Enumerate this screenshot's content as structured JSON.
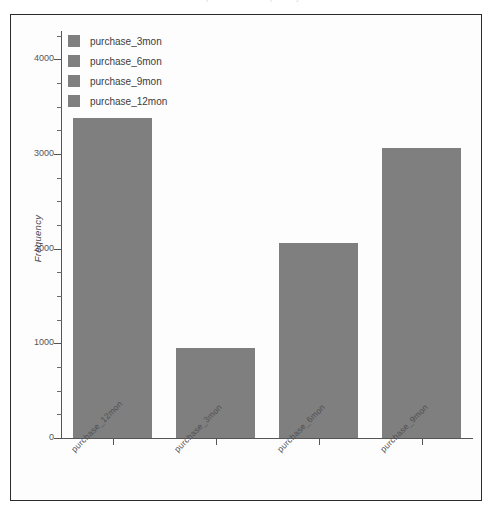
{
  "window": {
    "top_clip_text": "purchase frequency distribution"
  },
  "legend": {
    "position": "top-left",
    "items": [
      {
        "label": "purchase_3mon",
        "color": "#7f7f7f"
      },
      {
        "label": "purchase_6mon",
        "color": "#7f7f7f"
      },
      {
        "label": "purchase_9mon",
        "color": "#7f7f7f"
      },
      {
        "label": "purchase_12mon",
        "color": "#7f7f7f"
      }
    ]
  },
  "axes": {
    "y_title": "Frequency",
    "y_ticks": [
      "0",
      "1000",
      "2000",
      "3000",
      "4000"
    ],
    "x_labels": [
      "purchase_12mon",
      "purchase_3mon",
      "purchase_6mon",
      "purchase_9mon"
    ]
  },
  "chart_data": {
    "type": "bar",
    "title": "",
    "xlabel": "",
    "ylabel": "Frequency",
    "categories": [
      "purchase_12mon",
      "purchase_3mon",
      "purchase_6mon",
      "purchase_9mon"
    ],
    "values": [
      3380,
      950,
      2060,
      3060
    ],
    "ylim": [
      0,
      4300
    ],
    "yticks": [
      0,
      1000,
      2000,
      3000,
      4000
    ],
    "minor_ticks": true,
    "grid": false,
    "bar_color": "#7f7f7f",
    "legend": [
      "purchase_3mon",
      "purchase_6mon",
      "purchase_9mon",
      "purchase_12mon"
    ],
    "legend_position": "upper left"
  }
}
